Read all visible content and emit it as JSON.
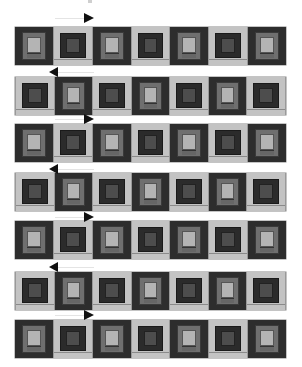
{
  "diagram": {
    "type": "quilt-row-assembly",
    "colors": {
      "dark": "#2d2d2d",
      "medium": "#6f6f6f",
      "light": "#b4b4b4",
      "light_frame": "#c3c3c3",
      "dark_center": "#4d4d4d",
      "arrow": "#111111"
    },
    "rows": [
      {
        "index": 1,
        "arrow": "right",
        "blocks": [
          "A",
          "B",
          "A",
          "B",
          "A",
          "B",
          "A"
        ]
      },
      {
        "index": 2,
        "arrow": "left",
        "blocks": [
          "B",
          "A",
          "B",
          "A",
          "B",
          "A",
          "B"
        ]
      },
      {
        "index": 3,
        "arrow": "right",
        "blocks": [
          "A",
          "B",
          "A",
          "B",
          "A",
          "B",
          "A"
        ]
      },
      {
        "index": 4,
        "arrow": "left",
        "blocks": [
          "B",
          "A",
          "B",
          "A",
          "B",
          "A",
          "B"
        ]
      },
      {
        "index": 5,
        "arrow": "right",
        "blocks": [
          "A",
          "B",
          "A",
          "B",
          "A",
          "B",
          "A"
        ]
      },
      {
        "index": 6,
        "arrow": "left",
        "blocks": [
          "B",
          "A",
          "B",
          "A",
          "B",
          "A",
          "B"
        ]
      },
      {
        "index": 7,
        "arrow": "right",
        "blocks": [
          "A",
          "B",
          "A",
          "B",
          "A",
          "B",
          "A"
        ]
      }
    ]
  }
}
